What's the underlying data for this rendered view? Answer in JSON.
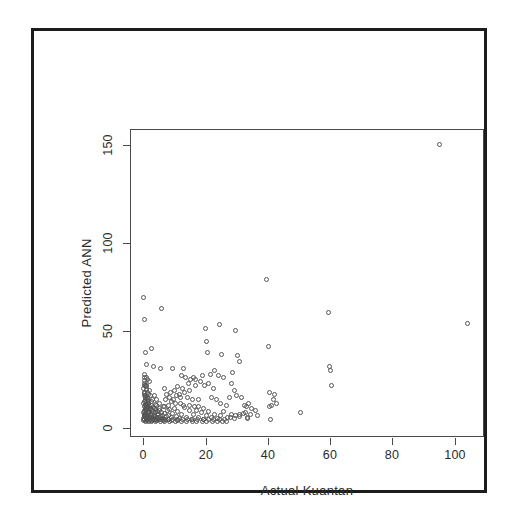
{
  "chart_data": {
    "type": "scatter",
    "title": "",
    "xlabel": "Actual Kuantan",
    "ylabel": "Predicted ANN",
    "xlim": [
      -4,
      110
    ],
    "ylim": [
      -8,
      160
    ],
    "xticks": [
      0,
      20,
      40,
      60,
      80,
      100
    ],
    "yticks": [
      0,
      50,
      100,
      150
    ],
    "xtick_labels": [
      "0",
      "20",
      "40",
      "60",
      "80",
      "100"
    ],
    "ytick_labels": [
      "0",
      "50",
      "100",
      "150"
    ],
    "grid": false,
    "legend": null,
    "marker": "open-circle",
    "marker_color": "#555555",
    "series": [
      {
        "name": "Predicted ANN vs Actual Kuantan",
        "points": [
          [
            0.2,
            68
          ],
          [
            0.3,
            56
          ],
          [
            6.0,
            62
          ],
          [
            0.6,
            38
          ],
          [
            2.8,
            40
          ],
          [
            0.9,
            31
          ],
          [
            3.2,
            30
          ],
          [
            5.6,
            29
          ],
          [
            9.4,
            29
          ],
          [
            0.4,
            26
          ],
          [
            0.5,
            24
          ],
          [
            1.4,
            23
          ],
          [
            1.9,
            22
          ],
          [
            0.3,
            21
          ],
          [
            0.8,
            20
          ],
          [
            1.1,
            19
          ],
          [
            0.2,
            18
          ],
          [
            2.1,
            17
          ],
          [
            0.5,
            16
          ],
          [
            1.6,
            15
          ],
          [
            0.3,
            14
          ],
          [
            2.4,
            14
          ],
          [
            0.7,
            13
          ],
          [
            1.2,
            12
          ],
          [
            3.1,
            12
          ],
          [
            0.4,
            11
          ],
          [
            1.8,
            10
          ],
          [
            0.2,
            10
          ],
          [
            2.6,
            9
          ],
          [
            0.9,
            9
          ],
          [
            4.1,
            9
          ],
          [
            0.3,
            8
          ],
          [
            1.5,
            8
          ],
          [
            2.2,
            7
          ],
          [
            0.6,
            7
          ],
          [
            3.5,
            7
          ],
          [
            0.4,
            6
          ],
          [
            1.1,
            6
          ],
          [
            2.9,
            6
          ],
          [
            5.2,
            6
          ],
          [
            0.2,
            5
          ],
          [
            1.7,
            5
          ],
          [
            3.8,
            5
          ],
          [
            0.8,
            4
          ],
          [
            2.3,
            4
          ],
          [
            4.6,
            4
          ],
          [
            0.5,
            4
          ],
          [
            1.3,
            3
          ],
          [
            2.7,
            3
          ],
          [
            6.1,
            3
          ],
          [
            0.3,
            3
          ],
          [
            1.9,
            2
          ],
          [
            3.4,
            2
          ],
          [
            5.0,
            2
          ],
          [
            0.7,
            2
          ],
          [
            2.1,
            2
          ],
          [
            4.2,
            1
          ],
          [
            7.3,
            1
          ],
          [
            0.4,
            1
          ],
          [
            1.2,
            1
          ],
          [
            2.5,
            1
          ],
          [
            3.9,
            1
          ],
          [
            5.8,
            1
          ],
          [
            8.1,
            1
          ],
          [
            0.2,
            0.5
          ],
          [
            1.0,
            0.5
          ],
          [
            2.0,
            0.5
          ],
          [
            3.0,
            0.5
          ],
          [
            4.4,
            0.5
          ],
          [
            6.5,
            0.5
          ],
          [
            9.0,
            0.5
          ],
          [
            11.2,
            0.5
          ],
          [
            0.6,
            0.2
          ],
          [
            1.6,
            0.2
          ],
          [
            2.8,
            0.2
          ],
          [
            4.0,
            0.2
          ],
          [
            5.5,
            0.2
          ],
          [
            7.0,
            0.2
          ],
          [
            8.6,
            0.2
          ],
          [
            10.4,
            0.2
          ],
          [
            12.5,
            0.2
          ],
          [
            14.0,
            0.2
          ],
          [
            15.8,
            0.2
          ],
          [
            17.2,
            0.2
          ],
          [
            19.0,
            0.2
          ],
          [
            20.6,
            0.2
          ],
          [
            22.4,
            0.2
          ],
          [
            24.0,
            0.2
          ],
          [
            25.6,
            0.2
          ],
          [
            27.0,
            0.2
          ],
          [
            13.1,
            29
          ],
          [
            12.3,
            25
          ],
          [
            13.8,
            24
          ],
          [
            11.0,
            19
          ],
          [
            12.8,
            18
          ],
          [
            10.2,
            17
          ],
          [
            14.6,
            21
          ],
          [
            15.4,
            23
          ],
          [
            16.2,
            24
          ],
          [
            17.0,
            23
          ],
          [
            18.4,
            22
          ],
          [
            19.1,
            25
          ],
          [
            16.8,
            20
          ],
          [
            15.0,
            17
          ],
          [
            13.4,
            16
          ],
          [
            11.6,
            15
          ],
          [
            10.8,
            14
          ],
          [
            12.0,
            13
          ],
          [
            14.2,
            13
          ],
          [
            16.0,
            12
          ],
          [
            17.8,
            12
          ],
          [
            9.8,
            12
          ],
          [
            8.4,
            13
          ],
          [
            7.6,
            15
          ],
          [
            8.9,
            16
          ],
          [
            6.8,
            18
          ],
          [
            7.2,
            12
          ],
          [
            9.1,
            11
          ],
          [
            10.5,
            10
          ],
          [
            11.9,
            10
          ],
          [
            13.0,
            9
          ],
          [
            14.8,
            9
          ],
          [
            16.5,
            8
          ],
          [
            18.0,
            8
          ],
          [
            19.6,
            7
          ],
          [
            8.2,
            9
          ],
          [
            6.4,
            8
          ],
          [
            5.1,
            10
          ],
          [
            4.3,
            12
          ],
          [
            3.6,
            14
          ],
          [
            20.0,
            51
          ],
          [
            24.8,
            53
          ],
          [
            20.3,
            44
          ],
          [
            20.8,
            38
          ],
          [
            25.2,
            37
          ],
          [
            23.0,
            28
          ],
          [
            21.0,
            21
          ],
          [
            22.6,
            18
          ],
          [
            19.8,
            20
          ],
          [
            21.6,
            26
          ],
          [
            24.2,
            25
          ],
          [
            26.0,
            24
          ],
          [
            22.0,
            13
          ],
          [
            23.6,
            12
          ],
          [
            25.0,
            10
          ],
          [
            26.8,
            9
          ],
          [
            28.0,
            13
          ],
          [
            29.4,
            17
          ],
          [
            30.0,
            50
          ],
          [
            30.6,
            36
          ],
          [
            31.2,
            33
          ],
          [
            29.0,
            27
          ],
          [
            28.6,
            21
          ],
          [
            30.2,
            14
          ],
          [
            31.8,
            13
          ],
          [
            32.6,
            9
          ],
          [
            33.4,
            8
          ],
          [
            34.0,
            10
          ],
          [
            33.0,
            5
          ],
          [
            31.0,
            4
          ],
          [
            29.8,
            3
          ],
          [
            28.2,
            2
          ],
          [
            26.4,
            1
          ],
          [
            24.6,
            1
          ],
          [
            22.8,
            1
          ],
          [
            21.2,
            1
          ],
          [
            19.4,
            1
          ],
          [
            17.6,
            1
          ],
          [
            16.0,
            1
          ],
          [
            14.4,
            1
          ],
          [
            12.6,
            1
          ],
          [
            11.0,
            1
          ],
          [
            9.4,
            1
          ],
          [
            8.0,
            1
          ],
          [
            6.6,
            1
          ],
          [
            5.4,
            1
          ],
          [
            4.0,
            1
          ],
          [
            2.6,
            1
          ],
          [
            1.4,
            1
          ],
          [
            0.5,
            1
          ],
          [
            40.0,
            78
          ],
          [
            40.4,
            41
          ],
          [
            41.0,
            16
          ],
          [
            42.4,
            15
          ],
          [
            42.0,
            12
          ],
          [
            43.0,
            10
          ],
          [
            41.6,
            9
          ],
          [
            40.8,
            8
          ],
          [
            41.2,
            1
          ],
          [
            51.0,
            5
          ],
          [
            60.0,
            60
          ],
          [
            60.4,
            30
          ],
          [
            60.6,
            28
          ],
          [
            61.0,
            20
          ],
          [
            96.0,
            152
          ],
          [
            105.0,
            54
          ],
          [
            35.0,
            7
          ],
          [
            36.2,
            6
          ],
          [
            34.6,
            4
          ],
          [
            37.0,
            3
          ],
          [
            33.8,
            2
          ],
          [
            0.2,
            1.5
          ],
          [
            0.3,
            2.5
          ],
          [
            0.4,
            3.5
          ],
          [
            0.5,
            5.5
          ],
          [
            0.6,
            8.5
          ],
          [
            0.7,
            11.5
          ],
          [
            0.8,
            14.5
          ],
          [
            0.9,
            17.5
          ],
          [
            1.0,
            6.5
          ],
          [
            1.1,
            3.2
          ],
          [
            1.2,
            9.2
          ],
          [
            1.3,
            13.2
          ],
          [
            1.4,
            4.8
          ],
          [
            1.5,
            1.8
          ],
          [
            1.6,
            7.8
          ],
          [
            1.7,
            11.0
          ],
          [
            1.8,
            2.2
          ],
          [
            1.9,
            5.2
          ],
          [
            2.0,
            8.2
          ],
          [
            2.2,
            3.8
          ],
          [
            2.4,
            6.8
          ],
          [
            2.6,
            10.8
          ],
          [
            2.8,
            2.0
          ],
          [
            3.0,
            4.6
          ],
          [
            3.2,
            7.6
          ],
          [
            3.4,
            1.2
          ],
          [
            3.6,
            3.4
          ],
          [
            3.8,
            6.4
          ],
          [
            4.0,
            9.4
          ],
          [
            4.2,
            2.4
          ],
          [
            4.5,
            5.4
          ],
          [
            4.8,
            1.0
          ],
          [
            5.0,
            3.6
          ],
          [
            5.3,
            7.0
          ],
          [
            5.6,
            2.8
          ],
          [
            6.0,
            5.0
          ],
          [
            6.3,
            1.6
          ],
          [
            6.7,
            4.2
          ],
          [
            7.0,
            8.0
          ],
          [
            7.4,
            2.6
          ],
          [
            7.8,
            6.0
          ],
          [
            8.2,
            3.0
          ],
          [
            8.6,
            6.6
          ],
          [
            9.0,
            2.0
          ],
          [
            9.5,
            4.4
          ],
          [
            10.0,
            7.2
          ],
          [
            10.6,
            2.8
          ],
          [
            11.2,
            5.6
          ],
          [
            11.8,
            1.4
          ],
          [
            12.4,
            4.0
          ],
          [
            13.2,
            7.4
          ],
          [
            14.0,
            2.2
          ],
          [
            14.8,
            5.8
          ],
          [
            15.6,
            1.0
          ],
          [
            16.4,
            3.6
          ],
          [
            17.2,
            6.2
          ],
          [
            18.0,
            2.0
          ],
          [
            18.8,
            4.8
          ],
          [
            19.6,
            1.2
          ],
          [
            20.4,
            3.2
          ],
          [
            21.2,
            5.6
          ],
          [
            22.0,
            2.4
          ],
          [
            23.0,
            4.0
          ],
          [
            24.0,
            1.6
          ],
          [
            25.0,
            3.0
          ],
          [
            26.0,
            5.2
          ],
          [
            27.2,
            2.0
          ],
          [
            28.4,
            3.8
          ],
          [
            29.6,
            1.4
          ],
          [
            31.0,
            2.6
          ],
          [
            32.4,
            4.4
          ],
          [
            33.6,
            1.8
          ],
          [
            0.25,
            22.5
          ],
          [
            0.35,
            19.5
          ],
          [
            0.45,
            15.5
          ],
          [
            0.55,
            12.5
          ],
          [
            0.65,
            9.5
          ],
          [
            0.75,
            6.5
          ],
          [
            0.85,
            3.5
          ],
          [
            0.95,
            0.8
          ],
          [
            1.05,
            24.0
          ],
          [
            1.15,
            20.0
          ],
          [
            1.25,
            16.0
          ],
          [
            1.35,
            11.0
          ],
          [
            1.45,
            7.0
          ]
        ]
      }
    ]
  },
  "axes": {
    "x": {
      "label": "Actual Kuantan",
      "ticks": [
        "0",
        "20",
        "40",
        "60",
        "80",
        "100"
      ]
    },
    "y": {
      "label": "Predicted ANN",
      "ticks": [
        "0",
        "50",
        "100",
        "150"
      ]
    }
  }
}
